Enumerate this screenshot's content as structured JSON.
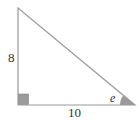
{
  "diagram": {
    "type": "right-triangle",
    "vertical_leg_label": "8",
    "horizontal_leg_label": "10",
    "angle_label": "e",
    "colors": {
      "stroke": "#9a9a9a",
      "fill_marker": "#9a9a9a",
      "text": "#333333",
      "background": "#ffffff"
    }
  }
}
